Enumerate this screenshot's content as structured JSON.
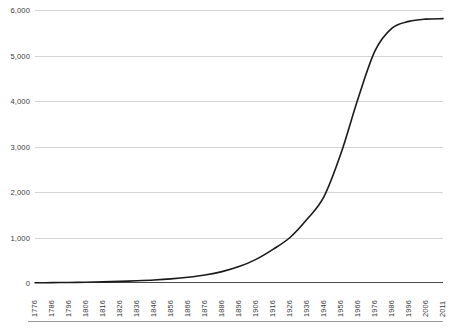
{
  "chart_data": {
    "type": "line",
    "title": "",
    "subtitle": "",
    "xlabel": "",
    "ylabel": "",
    "grid": true,
    "legend": false,
    "legend_position": "none",
    "line_color": "#1a1a1a",
    "gridline_color": "#d4d4d4",
    "axis_color": "#4a4a4a",
    "background_color": "#ffffff",
    "ylim": [
      0,
      6000
    ],
    "y_ticks": [
      "0",
      "1,000",
      "2,000",
      "3,000",
      "4,000",
      "5,000",
      "6,000"
    ],
    "y_tick_values": [
      0,
      1000,
      2000,
      3000,
      4000,
      5000,
      6000
    ],
    "x_tick_labels": [
      "1776",
      "1786",
      "1796",
      "1806",
      "1816",
      "1826",
      "1836",
      "1846",
      "1856",
      "1866",
      "1876",
      "1886",
      "1896",
      "1906",
      "1916",
      "1926",
      "1936",
      "1946",
      "1956",
      "1966",
      "1976",
      "1986",
      "1996",
      "2006",
      "2011"
    ],
    "x": [
      1776,
      1786,
      1796,
      1806,
      1816,
      1826,
      1836,
      1846,
      1856,
      1866,
      1876,
      1886,
      1896,
      1906,
      1916,
      1926,
      1936,
      1946,
      1956,
      1966,
      1976,
      1986,
      1996,
      2006,
      2011
    ],
    "values": [
      5,
      8,
      12,
      18,
      25,
      35,
      48,
      65,
      90,
      125,
      175,
      250,
      360,
      520,
      740,
      1000,
      1400,
      1900,
      2850,
      4050,
      5100,
      5600,
      5750,
      5800,
      5810
    ]
  }
}
